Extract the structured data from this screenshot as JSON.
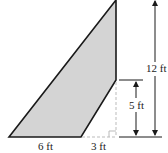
{
  "diagram": {
    "type": "geometry-figure",
    "colors": {
      "fill": "#d4d4d4",
      "stroke": "#1a1a1a",
      "dashed": "#bbbbbb",
      "text": "#222222"
    },
    "labels": {
      "base": "6 ft",
      "offset": "3 ft",
      "short_height": "5 ft",
      "total_height": "12 ft"
    },
    "shape": {
      "vertices": [
        [
          9,
          137
        ],
        [
          81,
          137
        ],
        [
          116,
          80
        ],
        [
          116,
          0
        ]
      ]
    }
  }
}
